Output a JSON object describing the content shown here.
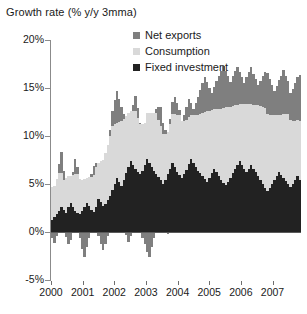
{
  "chart_data": {
    "type": "area",
    "stacked": true,
    "title": "Growth rate (% y/y 3mma)",
    "xlabel": "",
    "ylabel": "",
    "ylim": [
      -5,
      20
    ],
    "yticks": [
      20,
      15,
      10,
      5,
      0,
      -5
    ],
    "ytick_labels": [
      "20%",
      "15%",
      "10%",
      "5%",
      "0%",
      "-5%"
    ],
    "xlim": [
      2000.0,
      2007.9
    ],
    "xticks": [
      2000,
      2001,
      2002,
      2003,
      2004,
      2005,
      2006,
      2007
    ],
    "xtick_labels": [
      "2000",
      "2001",
      "2002",
      "2003",
      "2004",
      "2005",
      "2006",
      "2007"
    ],
    "grid": false,
    "legend_position": "top-center",
    "colors": {
      "net_exports": "#7f7f7f",
      "consumption": "#d9d9d9",
      "fixed_investment": "#222222",
      "axis": "#8b8b8b",
      "text": "#1a1a1a",
      "background": "#ffffff"
    },
    "series": [
      {
        "name": "Fixed investment",
        "color": "#222222",
        "order": 0,
        "values": [
          1.3,
          1.6,
          1.9,
          2.2,
          2.6,
          2.3,
          2.0,
          2.6,
          3.0,
          2.6,
          2.2,
          2.0,
          1.9,
          2.2,
          2.6,
          3.0,
          2.7,
          2.3,
          2.1,
          2.6,
          3.4,
          3.1,
          2.7,
          2.9,
          3.3,
          3.8,
          4.4,
          5.0,
          5.6,
          5.2,
          4.8,
          5.4,
          6.1,
          6.8,
          7.4,
          7.0,
          6.6,
          6.3,
          6.0,
          6.4,
          7.0,
          7.6,
          7.2,
          6.8,
          6.4,
          6.0,
          5.7,
          5.4,
          5.0,
          5.4,
          6.0,
          6.6,
          7.2,
          6.8,
          6.3,
          5.9,
          5.6,
          6.0,
          6.5,
          7.1,
          7.6,
          7.2,
          6.8,
          6.4,
          6.1,
          5.8,
          5.5,
          5.2,
          5.6,
          6.1,
          6.6,
          6.2,
          5.8,
          5.4,
          5.1,
          4.9,
          5.2,
          5.6,
          6.1,
          6.6,
          7.0,
          7.4,
          7.0,
          6.6,
          6.2,
          6.6,
          7.0,
          6.6,
          6.2,
          5.8,
          5.4,
          5.0,
          4.6,
          4.3,
          4.6,
          5.0,
          5.4,
          5.8,
          6.2,
          5.9,
          5.6,
          5.3,
          5.0,
          4.7,
          5.0,
          5.4,
          5.8,
          5.4
        ]
      },
      {
        "name": "Consumption",
        "color": "#d9d9d9",
        "order": 1,
        "values": [
          3.4,
          3.2,
          3.6,
          3.9,
          3.5,
          3.1,
          3.6,
          3.2,
          2.8,
          3.3,
          3.8,
          4.0,
          3.6,
          3.2,
          2.9,
          2.6,
          3.0,
          3.4,
          3.8,
          4.2,
          3.8,
          4.3,
          4.8,
          5.3,
          5.8,
          6.2,
          6.6,
          6.2,
          5.8,
          6.3,
          6.8,
          6.4,
          6.0,
          5.6,
          5.2,
          5.6,
          6.0,
          5.6,
          5.2,
          4.8,
          4.4,
          4.8,
          5.2,
          5.6,
          6.0,
          6.4,
          6.0,
          5.6,
          5.2,
          4.8,
          4.4,
          4.7,
          5.1,
          5.5,
          5.9,
          6.3,
          6.0,
          5.6,
          5.2,
          4.9,
          4.6,
          5.0,
          5.4,
          5.8,
          6.2,
          6.6,
          7.0,
          7.4,
          7.0,
          6.6,
          6.2,
          6.6,
          7.0,
          7.4,
          7.8,
          8.1,
          7.8,
          7.4,
          7.0,
          6.6,
          6.2,
          5.9,
          6.3,
          6.7,
          7.1,
          6.7,
          6.3,
          6.6,
          7.0,
          7.4,
          7.7,
          8.0,
          8.3,
          8.0,
          7.6,
          7.2,
          6.8,
          6.4,
          6.0,
          6.3,
          6.7,
          7.0,
          7.3,
          7.0,
          6.6,
          6.2,
          5.9,
          6.2
        ]
      },
      {
        "name": "Net exports",
        "color": "#7f7f7f",
        "order": 2,
        "values": [
          -0.6,
          -1.1,
          -0.4,
          1.0,
          2.2,
          1.0,
          -0.5,
          -1.3,
          -0.8,
          0.4,
          1.6,
          0.8,
          -0.6,
          -1.8,
          -2.6,
          -1.6,
          -0.6,
          0.3,
          1.0,
          0.4,
          -0.4,
          -1.2,
          -1.9,
          -1.2,
          -0.4,
          0.6,
          1.6,
          2.6,
          3.3,
          2.4,
          1.4,
          0.5,
          -0.3,
          -1.0,
          -0.4,
          0.6,
          1.6,
          1.0,
          0.2,
          -0.6,
          -1.3,
          -2.1,
          -2.6,
          -1.6,
          -0.6,
          0.4,
          1.3,
          2.0,
          1.2,
          0.4,
          -0.2,
          0.5,
          1.2,
          1.8,
          1.2,
          0.5,
          -0.1,
          0.6,
          1.3,
          1.9,
          1.2,
          0.6,
          1.2,
          1.9,
          2.5,
          3.1,
          3.6,
          3.0,
          2.4,
          1.8,
          2.3,
          2.9,
          3.5,
          4.0,
          4.4,
          3.8,
          3.2,
          2.6,
          3.1,
          3.6,
          4.0,
          3.4,
          2.8,
          2.2,
          2.8,
          3.4,
          3.9,
          3.3,
          2.7,
          2.1,
          2.6,
          3.2,
          3.8,
          4.3,
          3.7,
          3.1,
          2.5,
          3.0,
          3.6,
          4.1,
          4.6,
          4.0,
          3.4,
          2.8,
          3.3,
          3.9,
          4.4,
          4.8
        ]
      }
    ]
  },
  "legend": {
    "items": [
      {
        "label": "Net exports",
        "color": "#7f7f7f"
      },
      {
        "label": "Consumption",
        "color": "#d9d9d9"
      },
      {
        "label": "Fixed investment",
        "color": "#222222"
      }
    ]
  }
}
